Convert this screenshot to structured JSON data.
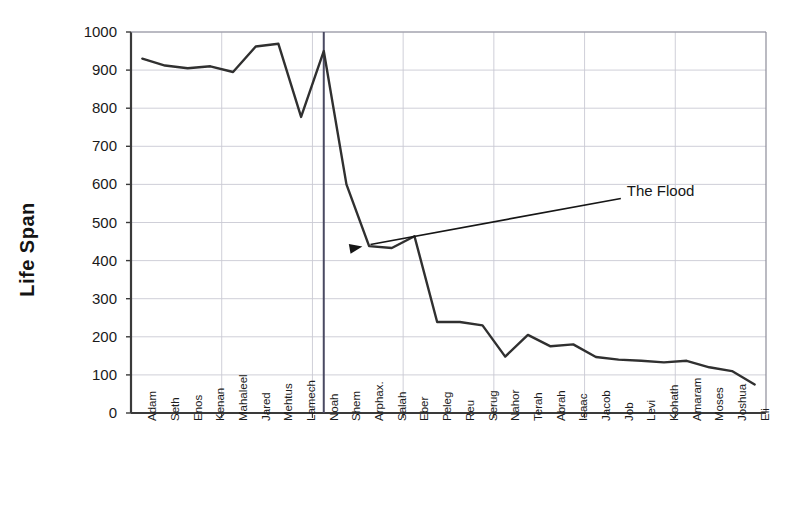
{
  "chart_data": {
    "type": "line",
    "title": "",
    "xlabel": "",
    "ylabel": "Life Span",
    "ylim": [
      0,
      1000
    ],
    "ytick_step": 100,
    "yticks": [
      "0",
      "100",
      "200",
      "300",
      "400",
      "500",
      "600",
      "700",
      "800",
      "900",
      "1000"
    ],
    "grid": true,
    "legend": "none",
    "categories": [
      "Adam",
      "Seth",
      "Enos",
      "Kenan",
      "Mahaleel",
      "Jared",
      "Mehtus",
      "Lamech",
      "Noah",
      "Shem",
      "Arphax.",
      "Salah",
      "Eber",
      "Peleg",
      "Reu",
      "Serug",
      "Nahor",
      "Terah",
      "Abrah",
      "Isaac",
      "Jacob",
      "Job",
      "Levi",
      "Kohath",
      "Amaram",
      "Moses",
      "Joshua",
      "Eli"
    ],
    "values": [
      930,
      912,
      905,
      910,
      895,
      962,
      969,
      777,
      950,
      600,
      438,
      433,
      464,
      239,
      239,
      230,
      148,
      205,
      175,
      180,
      147,
      140,
      137,
      133,
      137,
      120,
      110,
      75
    ],
    "series": [
      {
        "name": "Life Span",
        "color": "#303030",
        "values": [
          930,
          912,
          905,
          910,
          895,
          962,
          969,
          777,
          950,
          600,
          438,
          433,
          464,
          239,
          239,
          230,
          148,
          205,
          175,
          180,
          147,
          140,
          137,
          133,
          137,
          120,
          110,
          75
        ]
      }
    ],
    "annotations": [
      {
        "label": "The Flood",
        "type": "arrow-callout",
        "points_at_category": "Shem",
        "points_at_value": 437,
        "text_x_value": 21.6,
        "text_y_value": 563
      },
      {
        "label": "",
        "type": "vertical-rule",
        "at_category": "Noah",
        "from_value": 0,
        "to_value": 1000,
        "color": "#4a4a62"
      }
    ]
  },
  "colors": {
    "line": "#303030",
    "grid": "#c9c9d4",
    "axis": "#3a3a3a",
    "flood_rule": "#4a4a62",
    "text": "#161616",
    "background": "#ffffff"
  },
  "axis_labels": {
    "y_title": "Life Span"
  }
}
